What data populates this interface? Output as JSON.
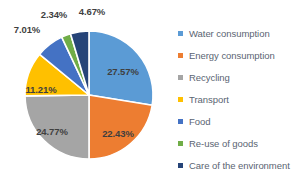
{
  "background": "#FFFFFF",
  "chart_data": {
    "type": "pie",
    "title": "",
    "start_angle_deg": 0,
    "direction": "clockwise",
    "legend_position": "right",
    "grid": false,
    "label_format": "percent",
    "categories": [
      "Water consumption",
      "Energy consumption",
      "Recycling",
      "Transport",
      "Food",
      "Re-use of goods",
      "Care of the environment"
    ],
    "values": [
      27.57,
      22.43,
      24.77,
      11.21,
      7.01,
      2.34,
      4.67
    ],
    "labels": [
      "27.57%",
      "22.43%",
      "24.77%",
      "11.21%",
      "7.01%",
      "2.34%",
      "4.67%"
    ],
    "colors": [
      "#5B9BD5",
      "#ED7D31",
      "#A5A5A5",
      "#FFC000",
      "#4472C4",
      "#70AD47",
      "#264478"
    ],
    "label_placement": [
      "inside",
      "inside",
      "inside",
      "inside",
      "outside",
      "outside",
      "outside"
    ]
  },
  "slices": [
    {
      "name": "Water consumption",
      "label": "27.57%",
      "value": 27.57,
      "color": "#5B9BD5",
      "lx": 123,
      "ly": 71
    },
    {
      "name": "Energy consumption",
      "label": "22.43%",
      "value": 22.43,
      "color": "#ED7D31",
      "lx": 118,
      "ly": 133
    },
    {
      "name": "Recycling",
      "label": "24.77%",
      "value": 24.77,
      "color": "#A5A5A5",
      "lx": 52,
      "ly": 131
    },
    {
      "name": "Transport",
      "label": "11.21%",
      "value": 11.21,
      "color": "#FFC000",
      "lx": 41,
      "ly": 89
    },
    {
      "name": "Food",
      "label": "7.01%",
      "value": 7.01,
      "color": "#4472C4",
      "lx": 27,
      "ly": 29
    },
    {
      "name": "Re-use of goods",
      "label": "2.34%",
      "value": 2.34,
      "color": "#70AD47",
      "lx": 54,
      "ly": 14
    },
    {
      "name": "Care of the environment",
      "label": "4.67%",
      "value": 4.67,
      "color": "#264478",
      "lx": 92,
      "ly": 11
    }
  ],
  "legend": {
    "items": [
      {
        "label": "Water consumption",
        "color": "#5B9BD5"
      },
      {
        "label": "Energy consumption",
        "color": "#ED7D31"
      },
      {
        "label": "Recycling",
        "color": "#A5A5A5"
      },
      {
        "label": "Transport",
        "color": "#FFC000"
      },
      {
        "label": "Food",
        "color": "#4472C4"
      },
      {
        "label": "Re-use of goods",
        "color": "#70AD47"
      },
      {
        "label": "Care of the environment",
        "color": "#264478"
      }
    ]
  }
}
